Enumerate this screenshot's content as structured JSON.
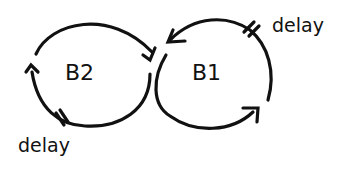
{
  "diagram": {
    "loops": [
      {
        "id": "B2",
        "label": "B2",
        "type": "balancing",
        "delay_label": "delay"
      },
      {
        "id": "B1",
        "label": "B1",
        "type": "balancing",
        "delay_label": "delay"
      }
    ],
    "colors": {
      "stroke": "#111111",
      "background": "#ffffff"
    }
  }
}
